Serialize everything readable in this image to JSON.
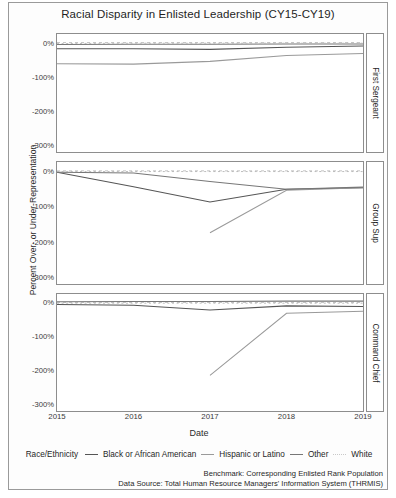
{
  "figure": {
    "title": "Racial Disparity in Enlisted Leadership (CY15-CY19)",
    "xlabel": "Date",
    "ylabel": "Percent Over- or Under-Representation",
    "legend_title": "Race/Ethnicity",
    "benchmark_note": "Benchmark: Corresponding Enlisted Rank Population",
    "source_note": "Data Source: Total Human Resource Managers' Information System (THRMIS)"
  },
  "chart_data": {
    "type": "line",
    "title": "Racial Disparity in Enlisted Leadership (CY15-CY19)",
    "xlabel": "Date",
    "ylabel": "Percent Over- or Under-Representation",
    "x": [
      2015,
      2016,
      2017,
      2018,
      2019
    ],
    "xticklabels": [
      "2015",
      "2016",
      "2017",
      "2018",
      "2019"
    ],
    "yticks": [
      0,
      -100,
      -200,
      -300
    ],
    "yticklabels": [
      "0%",
      "-100%",
      "-200%",
      "-300%"
    ],
    "ylim": [
      -320,
      25
    ],
    "grid": false,
    "legend_position": "bottom",
    "reference_line": 0,
    "panels": [
      {
        "label": "First Sergeant",
        "series": [
          {
            "name": "Black or African American",
            "values": [
              -18,
              -18,
              -20,
              -14,
              -10
            ],
            "color": "#555555",
            "dash": "none"
          },
          {
            "name": "Hispanic or Latino",
            "values": [
              -62,
              -63,
              -55,
              -38,
              -32
            ],
            "color": "#9a9a9a",
            "dash": "none"
          },
          {
            "name": "Other",
            "values": [
              -6,
              -5,
              -5,
              -4,
              -4
            ],
            "color": "#777777",
            "dash": "none"
          },
          {
            "name": "White",
            "values": [
              -3,
              -2,
              -2,
              -2,
              -2
            ],
            "color": "#b5b5b5",
            "dash": "dotted"
          }
        ]
      },
      {
        "label": "Group Sup",
        "series": [
          {
            "name": "Black or African American",
            "values": [
              -4,
              -45,
              -88,
              -52,
              -48
            ],
            "color": "#555555",
            "dash": "none"
          },
          {
            "name": "Hispanic or Latino",
            "values": [
              null,
              null,
              -175,
              -55,
              -48
            ],
            "color": "#9a9a9a",
            "dash": "none"
          },
          {
            "name": "Other",
            "values": [
              -4,
              -6,
              -30,
              -52,
              -46
            ],
            "color": "#777777",
            "dash": "none"
          },
          {
            "name": "White",
            "values": [
              -2,
              -2,
              -2,
              -2,
              -2
            ],
            "color": "#b5b5b5",
            "dash": "dotted"
          }
        ]
      },
      {
        "label": "Command Chief",
        "series": [
          {
            "name": "Black or African American",
            "values": [
              -6,
              -8,
              -22,
              -10,
              -12
            ],
            "color": "#555555",
            "dash": "none"
          },
          {
            "name": "Hispanic or Latino",
            "values": [
              null,
              null,
              -215,
              -32,
              -26
            ],
            "color": "#9a9a9a",
            "dash": "none"
          },
          {
            "name": "Other",
            "values": [
              2,
              3,
              3,
              4,
              4
            ],
            "color": "#777777",
            "dash": "none"
          },
          {
            "name": "White",
            "values": [
              -2,
              -2,
              -2,
              -2,
              -2
            ],
            "color": "#b5b5b5",
            "dash": "dotted"
          }
        ]
      }
    ],
    "legend_entries": [
      {
        "label": "Black or African American",
        "color": "#555555",
        "dash": "none"
      },
      {
        "label": "Hispanic or Latino",
        "color": "#9a9a9a",
        "dash": "none"
      },
      {
        "label": "Other",
        "color": "#777777",
        "dash": "none"
      },
      {
        "label": "White",
        "color": "#c9c9c9",
        "dash": "dotted"
      }
    ]
  }
}
